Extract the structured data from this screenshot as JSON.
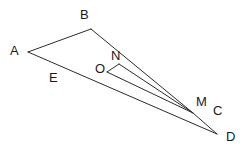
{
  "figure": {
    "width": 248,
    "height": 153,
    "background_color": "#ffffff",
    "stroke_color": "#2b2b2b",
    "stroke_width": 1,
    "label_color": "#1a1a1a",
    "label_font_size": 13,
    "points": {
      "A": {
        "x": 28,
        "y": 52,
        "label": "A",
        "label_x": 10,
        "label_y": 44
      },
      "B": {
        "x": 91,
        "y": 29,
        "label": "B",
        "label_x": 80,
        "label_y": 8
      },
      "C": {
        "x": 214,
        "y": 124,
        "label": "C",
        "label_x": 213,
        "label_y": 104
      },
      "D": {
        "x": 217,
        "y": 134,
        "label": "D",
        "label_x": 226,
        "label_y": 130
      },
      "E": {
        "x": 62,
        "y": 68,
        "label": "E",
        "label_x": 49,
        "label_y": 71
      },
      "M": {
        "x": 193,
        "y": 113,
        "label": "M",
        "label_x": 196,
        "label_y": 95
      },
      "N": {
        "x": 119,
        "y": 64,
        "label": "N",
        "label_x": 111,
        "label_y": 49
      },
      "O": {
        "x": 107,
        "y": 72,
        "label": "O",
        "label_x": 95,
        "label_y": 62
      }
    },
    "segments": [
      {
        "name": "segment-A-B",
        "from": "A",
        "to": "B",
        "d": "M 28 52 L 91 29"
      },
      {
        "name": "segment-B-M",
        "from": "B",
        "to": "M",
        "d": "M 91 29 L 193 113"
      },
      {
        "name": "segment-A-D",
        "from": "A",
        "to": "D",
        "d": "M 28 52 L 217 134"
      },
      {
        "name": "segment-M-D",
        "from": "M",
        "to": "D",
        "d": "M 193 113 L 217 134"
      },
      {
        "name": "segment-O-N",
        "from": "O",
        "to": "N",
        "d": "M 107 72 L 119 64"
      },
      {
        "name": "segment-N-M",
        "from": "N",
        "to": "M",
        "d": "M 119 64 L 193 113"
      },
      {
        "name": "segment-O-M",
        "from": "O",
        "to": "M",
        "d": "M 107 72 L 193 113"
      }
    ],
    "labels_order": [
      "B",
      "A",
      "N",
      "O",
      "E",
      "M",
      "C",
      "D"
    ]
  }
}
